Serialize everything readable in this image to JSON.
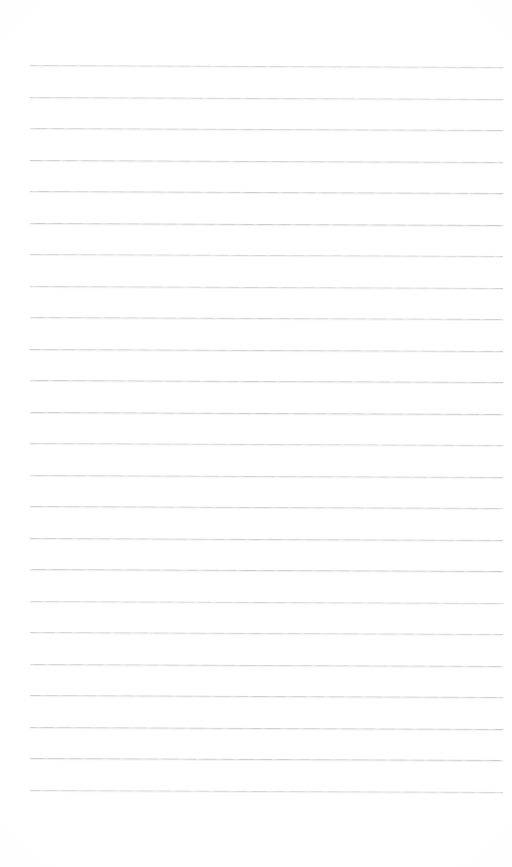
{
  "document": {
    "kind": "lined-paper",
    "title": "",
    "content_text": "",
    "page_width": 512,
    "page_height": 867,
    "background_color": "#ffffff"
  },
  "ruling": {
    "line_count": 24,
    "first_line_y": 65,
    "line_spacing": 31.5,
    "line_start_x": 30,
    "line_end_x": 503,
    "line_thickness": 1,
    "line_color": "#b9bcc4",
    "line_shadow_color": "#dfe1e6",
    "slope_px": 2,
    "style": "horizontal-ruled"
  },
  "margins": {
    "top": 65,
    "bottom": 77,
    "left": 30,
    "right": 9
  },
  "lines": [
    {
      "index": 1,
      "y": 65,
      "text": ""
    },
    {
      "index": 2,
      "y": 97,
      "text": ""
    },
    {
      "index": 3,
      "y": 128,
      "text": ""
    },
    {
      "index": 4,
      "y": 160,
      "text": ""
    },
    {
      "index": 5,
      "y": 191,
      "text": ""
    },
    {
      "index": 6,
      "y": 223,
      "text": ""
    },
    {
      "index": 7,
      "y": 254,
      "text": ""
    },
    {
      "index": 8,
      "y": 286,
      "text": ""
    },
    {
      "index": 9,
      "y": 317,
      "text": ""
    },
    {
      "index": 10,
      "y": 349,
      "text": ""
    },
    {
      "index": 11,
      "y": 380,
      "text": ""
    },
    {
      "index": 12,
      "y": 412,
      "text": ""
    },
    {
      "index": 13,
      "y": 443,
      "text": ""
    },
    {
      "index": 14,
      "y": 475,
      "text": ""
    },
    {
      "index": 15,
      "y": 506,
      "text": ""
    },
    {
      "index": 16,
      "y": 538,
      "text": ""
    },
    {
      "index": 17,
      "y": 569,
      "text": ""
    },
    {
      "index": 18,
      "y": 601,
      "text": ""
    },
    {
      "index": 19,
      "y": 632,
      "text": ""
    },
    {
      "index": 20,
      "y": 664,
      "text": ""
    },
    {
      "index": 21,
      "y": 695,
      "text": ""
    },
    {
      "index": 22,
      "y": 727,
      "text": ""
    },
    {
      "index": 23,
      "y": 758,
      "text": ""
    },
    {
      "index": 24,
      "y": 790,
      "text": ""
    }
  ]
}
